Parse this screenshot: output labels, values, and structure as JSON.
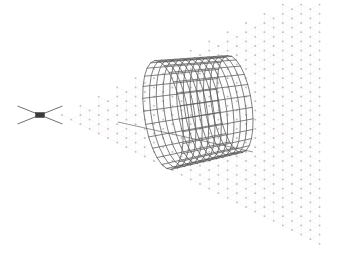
{
  "figure": {
    "title": "",
    "background_color": "#ffffff",
    "width": 337,
    "height": 257
  },
  "source_marker": {
    "name": "x-shaped-source-marker",
    "center": [
      40,
      115
    ],
    "arm_length": 22,
    "arm_color": "#4a4a4a",
    "hub": {
      "label": "",
      "width": 9,
      "height": 5,
      "color": "#3a3a3a"
    }
  },
  "beam_field": {
    "name": "conical-dot-field",
    "dot_color": "#c9b9bd",
    "dot_radius": 0.9,
    "spacing": 9.2,
    "apex": [
      62,
      115
    ],
    "half_angle_deg": 27,
    "max_x": 322,
    "link_line_color": "#f0ebec"
  },
  "cylinder": {
    "name": "wireframe-mesh-cylinder",
    "line_color": "#555555",
    "line_width": 0.75,
    "near_center": [
      163,
      115
    ],
    "far_center": [
      235,
      104
    ],
    "radius_near": 55,
    "radius_far": 49,
    "circumferential_segments": 26,
    "axial_segments": 11,
    "tilt_deg": -22
  },
  "axis_line": {
    "name": "cylinder-axis-line",
    "from": [
      118,
      122
    ],
    "to": [
      253,
      152
    ],
    "color": "#6a6a6a",
    "width": 0.7
  },
  "colors": {
    "ink": "#555555",
    "dots": "#c9b9bd",
    "hub": "#3a3a3a",
    "paper": "#ffffff"
  }
}
